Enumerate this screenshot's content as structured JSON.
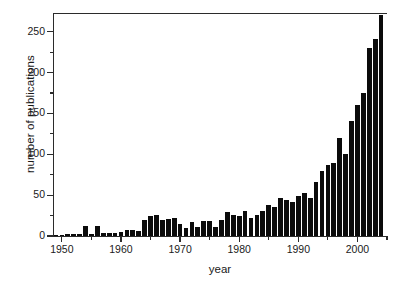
{
  "chart_data": {
    "type": "bar",
    "title": "",
    "subtitle": "",
    "xlabel": "year",
    "ylabel": "number of publications",
    "xlim": [
      1948.5,
      2005.0
    ],
    "ylim": [
      0,
      273
    ],
    "grid": false,
    "legend": null,
    "annotations": [],
    "x_ticks_major": [
      1950,
      1960,
      1970,
      1980,
      1990,
      2000
    ],
    "x_tick_labels": [
      "1950",
      "1960",
      "1970",
      "1980",
      "1990",
      "2000"
    ],
    "x_ticks_minor": [
      1955,
      1965,
      1975,
      1985,
      1995,
      2005
    ],
    "y_ticks_major": [
      0,
      50,
      100,
      150,
      200,
      250
    ],
    "y_tick_labels": [
      "0",
      "50",
      "100",
      "150",
      "200",
      "250"
    ],
    "y_ticks_minor": [
      25,
      75,
      125,
      175,
      225,
      275
    ],
    "bar_color": "#0b0b0b",
    "axis_color": "#2b2b2b",
    "background": "#ffffff",
    "categories": [
      1949,
      1950,
      1951,
      1952,
      1953,
      1954,
      1955,
      1956,
      1957,
      1958,
      1959,
      1960,
      1961,
      1962,
      1963,
      1964,
      1965,
      1966,
      1967,
      1968,
      1969,
      1970,
      1971,
      1972,
      1973,
      1974,
      1975,
      1976,
      1977,
      1978,
      1979,
      1980,
      1981,
      1982,
      1983,
      1984,
      1985,
      1986,
      1987,
      1988,
      1989,
      1990,
      1991,
      1992,
      1993,
      1994,
      1995,
      1996,
      1997,
      1998,
      1999,
      2000,
      2001,
      2002,
      2003,
      2004
    ],
    "values": [
      1,
      1,
      2,
      2,
      2,
      12,
      3,
      12,
      4,
      4,
      4,
      5,
      7,
      7,
      6,
      20,
      24,
      26,
      19,
      21,
      22,
      15,
      10,
      17,
      11,
      18,
      18,
      11,
      20,
      30,
      26,
      24,
      31,
      22,
      26,
      31,
      38,
      35,
      46,
      44,
      42,
      49,
      53,
      46,
      66,
      79,
      87,
      89,
      120,
      100,
      141,
      160,
      175,
      230,
      241,
      270
    ]
  }
}
